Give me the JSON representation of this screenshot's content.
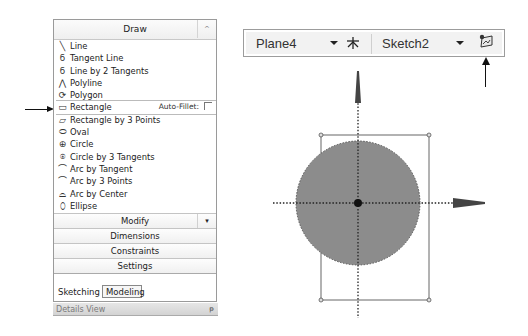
{
  "draw_panel": {
    "title": "Draw",
    "collapse_glyph": "^",
    "tools": [
      {
        "label": "Line",
        "icon": "line-icon",
        "glyph": "╲"
      },
      {
        "label": "Tangent Line",
        "icon": "tangent-line-icon",
        "glyph": "ϭ"
      },
      {
        "label": "Line by 2 Tangents",
        "icon": "line-by-2-tangents-icon",
        "glyph": "ϭ"
      },
      {
        "label": "Polyline",
        "icon": "polyline-icon",
        "glyph": "⋀"
      },
      {
        "label": "Polygon",
        "icon": "polygon-icon",
        "glyph": "⟳"
      },
      {
        "label": "Rectangle",
        "icon": "rectangle-icon",
        "glyph": "▭",
        "selected": true
      },
      {
        "label": "Rectangle by 3 Points",
        "icon": "rectangle-3-points-icon",
        "glyph": "▱"
      },
      {
        "label": "Oval",
        "icon": "oval-icon",
        "glyph": "⬭"
      },
      {
        "label": "Circle",
        "icon": "circle-icon",
        "glyph": "⊕"
      },
      {
        "label": "Circle by 3 Tangents",
        "icon": "circle-3-tangents-icon",
        "glyph": "⍟"
      },
      {
        "label": "Arc by Tangent",
        "icon": "arc-tangent-icon",
        "glyph": "⌒"
      },
      {
        "label": "Arc by 3 Points",
        "icon": "arc-3-points-icon",
        "glyph": "⌒"
      },
      {
        "label": "Arc by Center",
        "icon": "arc-center-icon",
        "glyph": "⌓"
      },
      {
        "label": "Ellipse",
        "icon": "ellipse-icon",
        "glyph": "⬯"
      }
    ],
    "auto_fillet_label": "Auto-Fillet:",
    "groups": {
      "modify": "Modify",
      "dimensions": "Dimensions",
      "constraints": "Constraints",
      "settings": "Settings"
    },
    "dropdown_glyph": "▾",
    "tabs": {
      "sketching": "Sketching",
      "modeling": "Modeling"
    },
    "details_view": "Details View",
    "pin_glyph": "ᵽ"
  },
  "toolbar": {
    "plane": "Plane4",
    "sketch": "Sketch2"
  },
  "colors": {
    "circle_fill": "#8c8c8c",
    "line": "#555555",
    "arrow": "#111111"
  }
}
